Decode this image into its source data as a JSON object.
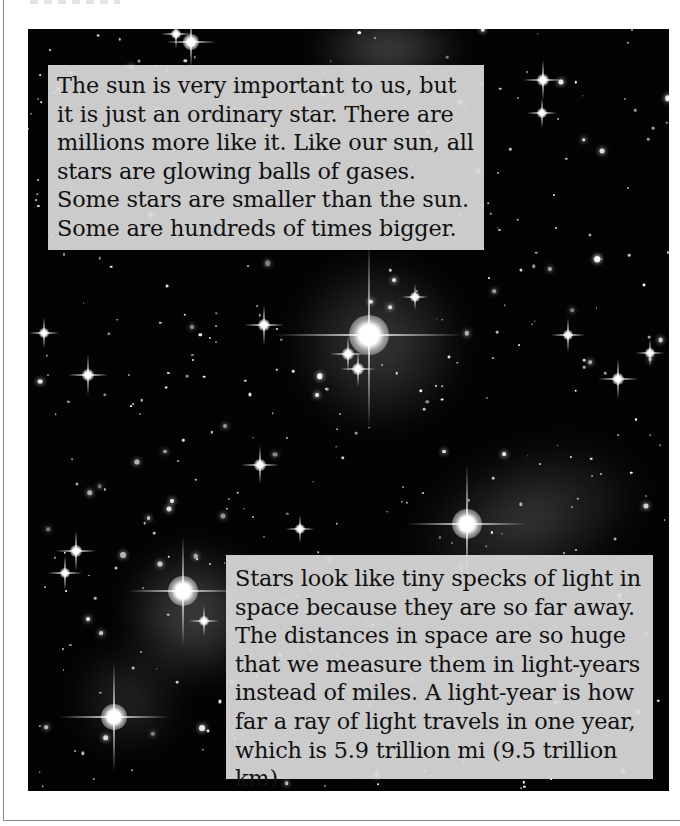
{
  "page": {
    "background": "#ffffff",
    "frame_color": "#8a8a8a"
  },
  "photo": {
    "subject": "star-field-photograph",
    "background_color": "#030303"
  },
  "captions": {
    "top": {
      "text": "The sun is very important to us, but it is just an ordinary star. There are millions more like it. Like our sun, all stars are glowing balls of gases. Some stars are smaller than the sun. Some are hundreds of times bigger."
    },
    "bottom": {
      "text": "Stars look like tiny specks of light in space because they are so far away. The distances in space are so huge that we measure them in light-years instead of miles. A light-year is how far a ray of light travels in one year, which is 5.9 trillion mi (9.5 trillion km)."
    },
    "box_color": "#dadada",
    "text_color": "#111111"
  }
}
